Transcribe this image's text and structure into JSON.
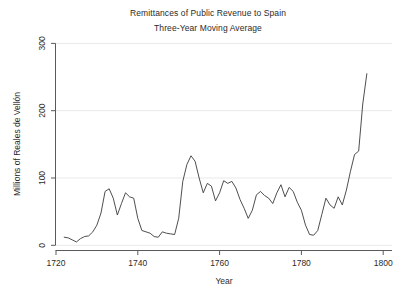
{
  "chart_data": {
    "type": "line",
    "title": "Remittances of Public Revenue to Spain",
    "subtitle": "Three-Year Moving Average",
    "xlabel": "Year",
    "ylabel": "Millions of Reales de Vellón",
    "xlim": [
      1718,
      1801
    ],
    "ylim": [
      0,
      300
    ],
    "xticks": [
      1720,
      1740,
      1760,
      1780,
      1800
    ],
    "xtick_labels": [
      "1720",
      "1740",
      "1760",
      "1780",
      "1800"
    ],
    "yticks": [
      0,
      100,
      200,
      300
    ],
    "ytick_labels": [
      "0",
      "100",
      "200",
      "300"
    ],
    "grid": "horizontal-major",
    "grid_color": "#e8e8e8",
    "legend": "none",
    "line_color": "#3a3a3a",
    "line_width": 0.9,
    "series": [
      {
        "name": "Remittances of Public Revenue to Spain (3-yr moving avg)",
        "x": [
          1722,
          1723,
          1724,
          1725,
          1726,
          1727,
          1728,
          1729,
          1730,
          1731,
          1732,
          1733,
          1734,
          1735,
          1736,
          1737,
          1738,
          1739,
          1740,
          1741,
          1742,
          1743,
          1744,
          1745,
          1746,
          1747,
          1748,
          1749,
          1750,
          1751,
          1752,
          1753,
          1754,
          1755,
          1756,
          1757,
          1758,
          1759,
          1760,
          1761,
          1762,
          1763,
          1764,
          1765,
          1766,
          1767,
          1768,
          1769,
          1770,
          1771,
          1772,
          1773,
          1774,
          1775,
          1776,
          1777,
          1778,
          1779,
          1780,
          1781,
          1782,
          1783,
          1784,
          1785,
          1786,
          1787,
          1788,
          1789,
          1790,
          1791,
          1792,
          1793,
          1794,
          1795,
          1796
        ],
        "y": [
          12,
          11,
          8,
          5,
          10,
          13,
          14,
          20,
          30,
          48,
          80,
          84,
          70,
          45,
          62,
          78,
          72,
          70,
          40,
          22,
          20,
          18,
          13,
          12,
          20,
          18,
          17,
          16,
          40,
          95,
          120,
          133,
          125,
          100,
          78,
          92,
          88,
          66,
          78,
          96,
          92,
          95,
          85,
          68,
          55,
          40,
          52,
          75,
          80,
          74,
          70,
          62,
          78,
          90,
          72,
          86,
          80,
          64,
          52,
          30,
          16,
          15,
          22,
          46,
          70,
          60,
          55,
          72,
          60,
          82,
          110,
          135,
          140,
          210,
          255
        ]
      }
    ]
  },
  "axes": {
    "y_axis_title": "Millions of Reales de Vellón",
    "x_axis_title": "Year"
  }
}
